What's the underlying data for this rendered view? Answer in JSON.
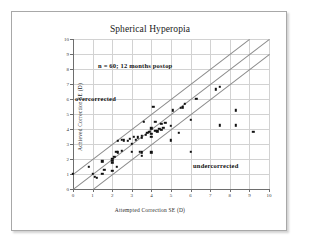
{
  "chart_data": {
    "type": "scatter",
    "title": "Spherical Hyperopia",
    "xlabel": "Attempted Correction SE (D)",
    "ylabel": "Achieved Correction SE (D)",
    "xlim": [
      0,
      10
    ],
    "ylim": [
      0,
      10
    ],
    "xticks": [
      0,
      1,
      2,
      3,
      4,
      5,
      6,
      7,
      8,
      9,
      10
    ],
    "yticks": [
      0,
      1,
      2,
      3,
      4,
      5,
      6,
      7,
      8,
      9,
      10
    ],
    "grid": true,
    "legend": "none",
    "marker_color": "#111111",
    "reference_lines": [
      {
        "name": "plus-one-diopter",
        "slope": 1,
        "intercept": 1
      },
      {
        "name": "identity",
        "slope": 1,
        "intercept": 0
      },
      {
        "name": "minus-one-diopter",
        "slope": 1,
        "intercept": -1
      }
    ],
    "annotations": [
      {
        "name": "sample-size",
        "text": "n = 60; 12 months postop",
        "x": 1.3,
        "y": 8.55
      },
      {
        "name": "overcorrected",
        "text": "overcorrected",
        "x": 0.1,
        "y": 6.3
      },
      {
        "name": "undercorrected",
        "text": "undercorrected",
        "x": 6.2,
        "y": 1.85
      }
    ],
    "points": [
      {
        "x": 0.0,
        "y": 1.0
      },
      {
        "x": 0.8,
        "y": 1.5
      },
      {
        "x": 1.0,
        "y": 1.0
      },
      {
        "x": 1.1,
        "y": 0.8
      },
      {
        "x": 1.2,
        "y": 0.75
      },
      {
        "x": 1.5,
        "y": 1.0
      },
      {
        "x": 1.5,
        "y": 1.85
      },
      {
        "x": 1.6,
        "y": 1.3
      },
      {
        "x": 2.0,
        "y": 1.2
      },
      {
        "x": 2.0,
        "y": 1.75
      },
      {
        "x": 2.0,
        "y": 1.9
      },
      {
        "x": 2.0,
        "y": 2.0
      },
      {
        "x": 2.1,
        "y": 2.15
      },
      {
        "x": 2.2,
        "y": 2.5
      },
      {
        "x": 2.25,
        "y": 1.5
      },
      {
        "x": 2.3,
        "y": 2.45
      },
      {
        "x": 2.3,
        "y": 3.2
      },
      {
        "x": 2.5,
        "y": 3.3
      },
      {
        "x": 2.5,
        "y": 2.55
      },
      {
        "x": 2.6,
        "y": 3.25
      },
      {
        "x": 2.8,
        "y": 3.2
      },
      {
        "x": 2.9,
        "y": 3.35
      },
      {
        "x": 3.0,
        "y": 3.0
      },
      {
        "x": 3.0,
        "y": 2.5
      },
      {
        "x": 3.1,
        "y": 3.5
      },
      {
        "x": 3.2,
        "y": 3.3
      },
      {
        "x": 3.3,
        "y": 3.45
      },
      {
        "x": 3.4,
        "y": 2.5
      },
      {
        "x": 3.5,
        "y": 2.2
      },
      {
        "x": 3.5,
        "y": 2.45
      },
      {
        "x": 3.5,
        "y": 3.4
      },
      {
        "x": 3.5,
        "y": 3.55
      },
      {
        "x": 3.6,
        "y": 4.5
      },
      {
        "x": 3.7,
        "y": 3.6
      },
      {
        "x": 3.8,
        "y": 3.75
      },
      {
        "x": 3.9,
        "y": 3.8
      },
      {
        "x": 4.0,
        "y": 2.45
      },
      {
        "x": 4.0,
        "y": 3.5
      },
      {
        "x": 4.0,
        "y": 3.7
      },
      {
        "x": 4.0,
        "y": 4.05
      },
      {
        "x": 4.1,
        "y": 5.5
      },
      {
        "x": 4.2,
        "y": 3.9
      },
      {
        "x": 4.2,
        "y": 4.5
      },
      {
        "x": 4.3,
        "y": 3.85
      },
      {
        "x": 4.4,
        "y": 4.0
      },
      {
        "x": 4.5,
        "y": 3.95
      },
      {
        "x": 4.5,
        "y": 4.35
      },
      {
        "x": 4.6,
        "y": 4.1
      },
      {
        "x": 4.7,
        "y": 4.4
      },
      {
        "x": 5.0,
        "y": 3.25
      },
      {
        "x": 5.0,
        "y": 4.2
      },
      {
        "x": 5.1,
        "y": 5.25
      },
      {
        "x": 5.4,
        "y": 3.75
      },
      {
        "x": 5.5,
        "y": 5.4
      },
      {
        "x": 5.6,
        "y": 5.45
      },
      {
        "x": 5.7,
        "y": 5.7
      },
      {
        "x": 6.0,
        "y": 2.5
      },
      {
        "x": 6.0,
        "y": 4.6
      },
      {
        "x": 6.3,
        "y": 6.0
      },
      {
        "x": 7.3,
        "y": 6.65
      },
      {
        "x": 7.5,
        "y": 6.8
      },
      {
        "x": 7.5,
        "y": 4.25
      },
      {
        "x": 8.3,
        "y": 5.25
      },
      {
        "x": 8.3,
        "y": 4.25
      },
      {
        "x": 9.2,
        "y": 3.8
      }
    ]
  }
}
